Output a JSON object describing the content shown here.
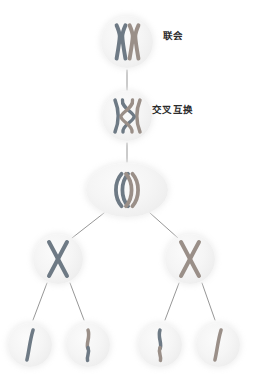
{
  "diagram": {
    "background_color": "#ffffff",
    "cell_fill_color": "#f2f2f2",
    "edge_color": "#8a8a8a",
    "chromosome_colors": {
      "maternal": "#6e7a85",
      "paternal": "#9a8f88",
      "outline": "#5d656d"
    },
    "labels": [
      {
        "id": "synapsis",
        "text": "联会",
        "x": 163,
        "y": 31
      },
      {
        "id": "crossing-over",
        "text": "交叉互换",
        "x": 152,
        "y": 105
      }
    ],
    "levels": [
      {
        "id": "level-1-synapsis",
        "name": "联会",
        "cells": [
          {
            "id": "cell-synapsis",
            "cx": 127,
            "cy": 42,
            "rx": 26,
            "ry": 26,
            "glyph": "synapsed-pair"
          }
        ]
      },
      {
        "id": "level-2-crossing-over",
        "name": "交叉互换",
        "cells": [
          {
            "id": "cell-crossover",
            "cx": 127,
            "cy": 116,
            "rx": 25,
            "ry": 25,
            "glyph": "chiasma-pair"
          }
        ]
      },
      {
        "id": "level-3-anaphase-one",
        "name": "同源染色体分离",
        "cells": [
          {
            "id": "cell-anaphase-one",
            "cx": 127,
            "cy": 190,
            "rx": 41,
            "ry": 27,
            "glyph": "separating-pair"
          }
        ]
      },
      {
        "id": "level-4-secondary",
        "name": "次级细胞",
        "cells": [
          {
            "id": "cell-secondary-left",
            "cx": 58,
            "cy": 259,
            "rx": 25,
            "ry": 25,
            "glyph": "x-chromosome-maternal"
          },
          {
            "id": "cell-secondary-right",
            "cx": 190,
            "cy": 259,
            "rx": 25,
            "ry": 25,
            "glyph": "x-chromosome-paternal"
          }
        ]
      },
      {
        "id": "level-5-gametes",
        "name": "配子",
        "cells": [
          {
            "id": "cell-gamete-1",
            "cx": 30,
            "cy": 345,
            "rx": 22,
            "ry": 22,
            "glyph": "chromatid-parental-a"
          },
          {
            "id": "cell-gamete-2",
            "cx": 88,
            "cy": 345,
            "rx": 22,
            "ry": 22,
            "glyph": "chromatid-recombinant-a"
          },
          {
            "id": "cell-gamete-3",
            "cx": 160,
            "cy": 345,
            "rx": 22,
            "ry": 22,
            "glyph": "chromatid-recombinant-b"
          },
          {
            "id": "cell-gamete-4",
            "cx": 218,
            "cy": 345,
            "rx": 22,
            "ry": 22,
            "glyph": "chromatid-parental-b"
          }
        ]
      }
    ],
    "edges": [
      {
        "id": "edge-synapsis-to-crossover",
        "x1": 127,
        "y1": 70,
        "x2": 127,
        "y2": 90
      },
      {
        "id": "edge-crossover-to-anaphase",
        "x1": 127,
        "y1": 143,
        "x2": 127,
        "y2": 162
      },
      {
        "id": "edge-anaphase-to-secondary-left",
        "x1": 104,
        "y1": 213,
        "x2": 72,
        "y2": 238
      },
      {
        "id": "edge-anaphase-to-secondary-right",
        "x1": 150,
        "y1": 213,
        "x2": 178,
        "y2": 238
      },
      {
        "id": "edge-secondary-left-to-gamete-1",
        "x1": 47,
        "y1": 283,
        "x2": 33,
        "y2": 320
      },
      {
        "id": "edge-secondary-left-to-gamete-2",
        "x1": 70,
        "y1": 283,
        "x2": 84,
        "y2": 320
      },
      {
        "id": "edge-secondary-right-to-gamete-3",
        "x1": 179,
        "y1": 283,
        "x2": 165,
        "y2": 320
      },
      {
        "id": "edge-secondary-right-to-gamete-4",
        "x1": 202,
        "y1": 283,
        "x2": 215,
        "y2": 320
      }
    ]
  }
}
